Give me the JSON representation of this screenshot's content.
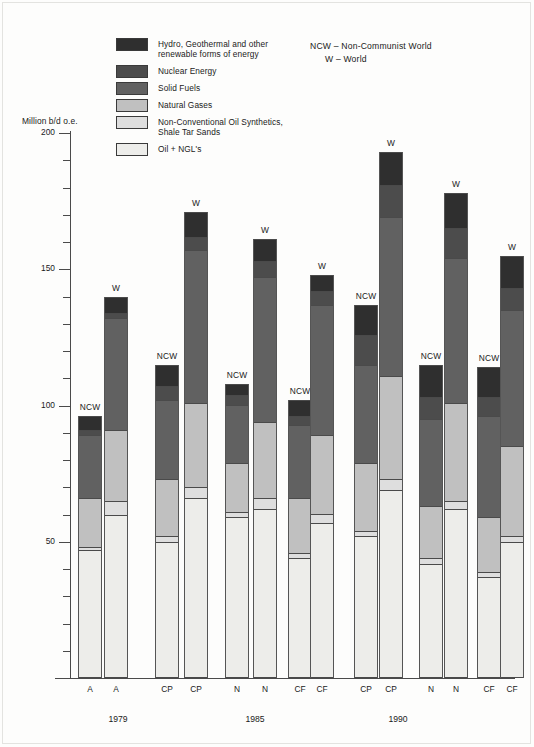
{
  "axis": {
    "y_title": "Million b/d o.e.",
    "major_ticks": [
      "200",
      "150",
      "100",
      "50"
    ],
    "major_values": [
      200,
      150,
      100,
      50
    ],
    "minor_step": 10,
    "ylim": [
      0,
      200
    ]
  },
  "abbreviations": {
    "line1": "NCW – Non-Communist World",
    "line2": "W – World"
  },
  "legend": {
    "items": [
      {
        "label": "Hydro, Geothermal and other\nrenewable forms of energy",
        "color": "#2f2f2f",
        "key": "hydro"
      },
      {
        "label": "Nuclear Energy",
        "color": "#4c4c4c",
        "key": "nuclear"
      },
      {
        "label": "Solid Fuels",
        "color": "#616161",
        "key": "solid"
      },
      {
        "label": "Natural Gases",
        "color": "#c0c0c0",
        "key": "gas"
      },
      {
        "label": "Non-Conventional Oil Synthetics,\nShale Tar Sands",
        "color": "#dedede",
        "key": "noncon"
      },
      {
        "label": "Oil + NGL's",
        "color": "#ededea",
        "key": "oil"
      }
    ]
  },
  "chart_data": {
    "type": "bar",
    "subtype": "stacked",
    "title": "",
    "xlabel": "",
    "ylabel": "Million b/d o.e.",
    "ylim": [
      0,
      200
    ],
    "grid": false,
    "legend_position": "top-left",
    "stack_order_bottom_to_top": [
      "oil",
      "noncon",
      "gas",
      "solid",
      "nuclear",
      "hydro"
    ],
    "series": [
      {
        "name": "Oil + NGL's",
        "key": "oil",
        "color": "#ededea"
      },
      {
        "name": "Non-Conventional Oil Synthetics, Shale Tar Sands",
        "key": "noncon",
        "color": "#dedede"
      },
      {
        "name": "Natural Gases",
        "key": "gas",
        "color": "#c0c0c0"
      },
      {
        "name": "Solid Fuels",
        "key": "solid",
        "color": "#616161"
      },
      {
        "name": "Nuclear Energy",
        "key": "nuclear",
        "color": "#4c4c4c"
      },
      {
        "name": "Hydro, Geothermal and other renewable forms of energy",
        "key": "hydro",
        "color": "#2f2f2f"
      }
    ],
    "groups": [
      {
        "period": "1979",
        "label": "1979"
      },
      {
        "period": "1985",
        "label": "1985"
      },
      {
        "period": "1990",
        "label": "1990"
      }
    ],
    "bars": [
      {
        "id": "b1",
        "group": "1979",
        "scenario": "A",
        "scope": "NCW",
        "tag": "NCW",
        "x": 78,
        "total": 96,
        "oil": 47,
        "noncon": 1,
        "gas": 18,
        "solid": 23,
        "nuclear": 2,
        "hydro": 5
      },
      {
        "id": "b2",
        "group": "1979",
        "scenario": "A",
        "scope": "W",
        "tag": "W",
        "x": 104,
        "total": 140,
        "oil": 60,
        "noncon": 5,
        "gas": 26,
        "solid": 41,
        "nuclear": 2,
        "hydro": 6
      },
      {
        "id": "b3",
        "group": "1985",
        "scenario": "CP",
        "scope": "NCW",
        "tag": "NCW",
        "x": 155,
        "total": 115,
        "oil": 50,
        "noncon": 2,
        "gas": 21,
        "solid": 29,
        "nuclear": 5,
        "hydro": 8
      },
      {
        "id": "b4",
        "group": "1985",
        "scenario": "CP",
        "scope": "W",
        "tag": "W",
        "x": 184,
        "total": 171,
        "oil": 66,
        "noncon": 4,
        "gas": 31,
        "solid": 56,
        "nuclear": 5,
        "hydro": 9
      },
      {
        "id": "b5",
        "group": "1985",
        "scenario": "N",
        "scope": "NCW",
        "tag": "NCW",
        "x": 225,
        "total": 108,
        "oil": 59,
        "noncon": 2,
        "gas": 18,
        "solid": 21,
        "nuclear": 4,
        "hydro": 4
      },
      {
        "id": "b6",
        "group": "1985",
        "scenario": "N",
        "scope": "W",
        "tag": "W",
        "x": 253,
        "total": 161,
        "oil": 62,
        "noncon": 4,
        "gas": 28,
        "solid": 53,
        "nuclear": 6,
        "hydro": 8
      },
      {
        "id": "b7",
        "group": "1985",
        "scenario": "CF",
        "scope": "NCW",
        "tag": "NCW",
        "x": 288,
        "total": 102,
        "oil": 44,
        "noncon": 2,
        "gas": 20,
        "solid": 27,
        "nuclear": 3,
        "hydro": 6
      },
      {
        "id": "b8",
        "group": "1985",
        "scenario": "CF",
        "scope": "W",
        "tag": "W",
        "x": 310,
        "total": 148,
        "oil": 57,
        "noncon": 3,
        "gas": 29,
        "solid": 48,
        "nuclear": 5,
        "hydro": 6
      },
      {
        "id": "b9",
        "group": "1990",
        "scenario": "CP",
        "scope": "NCW",
        "tag": "NCW",
        "x": 354,
        "total": 137,
        "oil": 52,
        "noncon": 2,
        "gas": 25,
        "solid": 36,
        "nuclear": 11,
        "hydro": 11
      },
      {
        "id": "b10",
        "group": "1990",
        "scenario": "CP",
        "scope": "W",
        "tag": "W",
        "x": 379,
        "total": 193,
        "oil": 69,
        "noncon": 4,
        "gas": 38,
        "solid": 58,
        "nuclear": 12,
        "hydro": 12
      },
      {
        "id": "b11",
        "group": "1990",
        "scenario": "N",
        "scope": "NCW",
        "tag": "NCW",
        "x": 419,
        "total": 115,
        "oil": 42,
        "noncon": 2,
        "gas": 19,
        "solid": 32,
        "nuclear": 8,
        "hydro": 12
      },
      {
        "id": "b12",
        "group": "1990",
        "scenario": "N",
        "scope": "W",
        "tag": "W",
        "x": 444,
        "total": 178,
        "oil": 62,
        "noncon": 3,
        "gas": 36,
        "solid": 53,
        "nuclear": 11,
        "hydro": 13
      },
      {
        "id": "b13",
        "group": "1990",
        "scenario": "CF",
        "scope": "NCW",
        "tag": "NCW",
        "x": 477,
        "total": 114,
        "oil": 37,
        "noncon": 2,
        "gas": 20,
        "solid": 37,
        "nuclear": 7,
        "hydro": 11
      },
      {
        "id": "b14",
        "group": "1990",
        "scenario": "CF",
        "scope": "W",
        "tag": "W",
        "x": 500,
        "total": 155,
        "oil": 50,
        "noncon": 2,
        "gas": 33,
        "solid": 50,
        "nuclear": 8,
        "hydro": 12
      }
    ],
    "x_tick_labels": [
      "A",
      "A",
      "CP",
      "CP",
      "N",
      "N",
      "CF",
      "CF",
      "CP",
      "CP",
      "N",
      "N",
      "CF",
      "CF"
    ],
    "group_labels": [
      "1979",
      "1985",
      "1990"
    ]
  },
  "geometry": {
    "baseline_y": 678,
    "px_per_unit": 2.725,
    "bar_width": 24,
    "group_label_x": [
      118,
      255,
      398
    ]
  }
}
